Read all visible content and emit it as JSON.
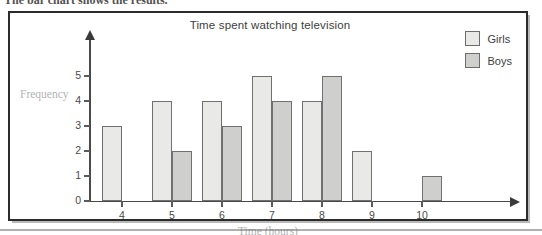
{
  "header": {
    "cropped_text": "The bar chart shows the results."
  },
  "figure": {
    "title": "Time spent watching television"
  },
  "legend": {
    "items": [
      {
        "label": "Girls",
        "color": "#e9e9e7"
      },
      {
        "label": "Boys",
        "color": "#cfcfcd"
      }
    ]
  },
  "axes": {
    "ylabel": "Frequency",
    "xlabel": "Time (hours)",
    "yticks": [
      "0",
      "1",
      "2",
      "3",
      "4",
      "5"
    ],
    "xticks": [
      "4",
      "5",
      "6",
      "7",
      "8",
      "9",
      "10"
    ]
  },
  "chart_data": {
    "type": "bar",
    "title": "Time spent watching television",
    "xlabel": "Time (hours)",
    "ylabel": "Frequency",
    "categories": [
      "4",
      "5",
      "6",
      "7",
      "8",
      "9",
      "10"
    ],
    "series": [
      {
        "name": "Girls",
        "color": "#e9e9e7",
        "values": [
          3,
          4,
          4,
          5,
          4,
          2,
          0
        ]
      },
      {
        "name": "Boys",
        "color": "#cfcfcd",
        "values": [
          0,
          2,
          3,
          4,
          5,
          0,
          1
        ]
      }
    ],
    "ylim": [
      0,
      5
    ],
    "grid": false,
    "legend_position": "top-right"
  }
}
